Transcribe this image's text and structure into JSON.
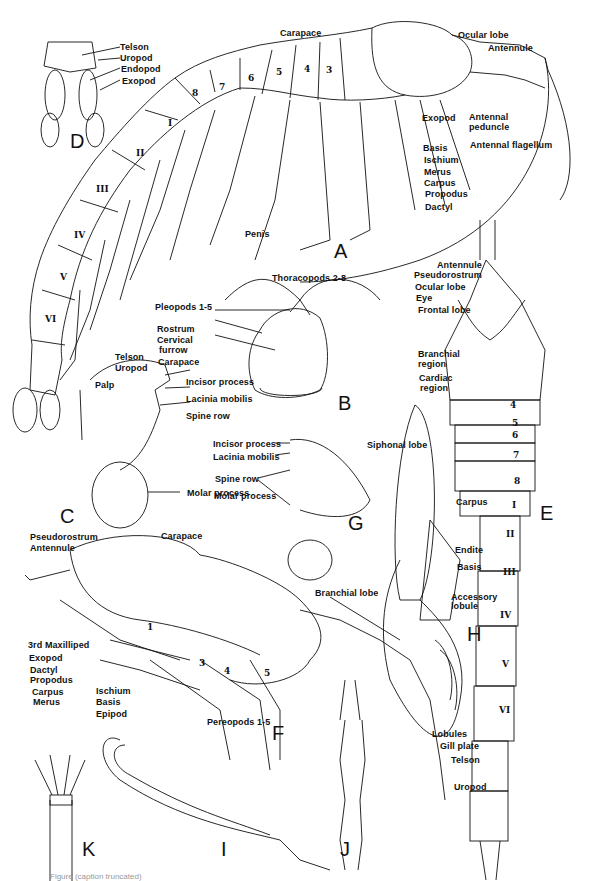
{
  "figure": {
    "panels": {
      "A": "A",
      "B": "B",
      "C": "C",
      "D": "D",
      "E": "E",
      "F": "F",
      "G": "G",
      "H": "H",
      "I": "I",
      "J": "J",
      "K": "K"
    },
    "panel_A": {
      "labels": {
        "carapace": "Carapace",
        "ocular_lobe": "Ocular lobe",
        "antennule": "Antennule",
        "exopod": "Exopod",
        "antennal_peduncle_1": "Antennal",
        "antennal_peduncle_2": "peduncle",
        "antennal_flagellum": "Antennal flagellum",
        "basis": "Basis",
        "ischium": "Ischium",
        "merus": "Merus",
        "carpus": "Carpus",
        "propodus": "Propodus",
        "dactyl": "Dactyl",
        "penis": "Penis",
        "thoracopods": "Thoracopods 2-8",
        "pleopods": "Pleopods 1-5",
        "telson": "Telson",
        "uropod": "Uropod"
      },
      "thoracic_segments": [
        "8",
        "7",
        "6",
        "5",
        "4",
        "3"
      ],
      "abdominal_segments": [
        "I",
        "II",
        "III",
        "IV",
        "V",
        "VI"
      ]
    },
    "panel_D": {
      "labels": {
        "telson": "Telson",
        "uropod": "Uropod",
        "endopod": "Endopod",
        "exopod": "Exopod"
      }
    },
    "panel_B": {
      "labels": {
        "rostrum": "Rostrum",
        "cervical_1": "Cervical",
        "cervical_2": "furrow",
        "carapace": "Carapace"
      }
    },
    "panel_C": {
      "labels": {
        "palp": "Palp",
        "incisor": "Incisor process",
        "lacinia": "Lacinia mobilis",
        "spine_row": "Spine row",
        "molar": "Molar process"
      }
    },
    "panel_G": {
      "labels": {
        "incisor": "Incisor process",
        "lacinia": "Lacinia mobilis",
        "spine_row": "Spine row",
        "molar": "Molar process"
      }
    },
    "panel_E": {
      "labels": {
        "antennule": "Antennule",
        "pseudorostrum": "Pseudorostrum",
        "ocular_lobe": "Ocular lobe",
        "eye": "Eye",
        "frontal_lobe": "Frontal lobe",
        "branchial_1": "Branchial",
        "branchial_2": "region",
        "cardiac_1": "Cardiac",
        "cardiac_2": "region"
      },
      "thoracic_segments": [
        "4",
        "5",
        "6",
        "7",
        "8"
      ],
      "abdominal_segments": [
        "I",
        "II",
        "III",
        "IV",
        "V",
        "VI"
      ]
    },
    "panel_H": {
      "labels": {
        "siphonal_lobe": "Siphonal lobe",
        "carpus": "Carpus",
        "endite": "Endite",
        "basis": "Basis",
        "accessory_1": "Accessory",
        "accessory_2": "lobule",
        "branchial_lobe": "Branchial lobe",
        "lobules": "Lobules",
        "gill_plate": "Gill plate"
      }
    },
    "panel_F": {
      "labels": {
        "pseudorostrum": "Pseudorostrum",
        "antennule": "Antennule",
        "carapace": "Carapace",
        "maxilliped": "3rd Maxilliped",
        "exopod": "Exopod",
        "dactyl": "Dactyl",
        "propodus": "Propodus",
        "carpus": "Carpus",
        "merus": "Merus",
        "ischium": "Ischium",
        "basis": "Basis",
        "epipod": "Epipod",
        "pereopods": "Pereopods 1-5"
      },
      "leg_numbers": [
        "1",
        "3",
        "4",
        "5"
      ]
    },
    "panel_J": {
      "labels": {
        "telson": "Telson",
        "uropod": "Uropod"
      }
    },
    "caption": "Figure (caption truncated)"
  }
}
